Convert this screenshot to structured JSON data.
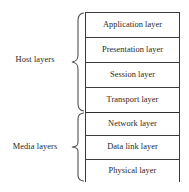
{
  "diagram": {
    "background_color": "#ffffff",
    "border_color": "#3c3c3c",
    "text_color": "#1f1f1f",
    "brace_color": "#4a4a4a"
  },
  "groups": [
    {
      "id": "host",
      "label": "Host layers",
      "brace_glyph": "left-curly-brace",
      "layers": [
        {
          "name": "Application layer"
        },
        {
          "name": "Presentation layer"
        },
        {
          "name": "Session layer"
        },
        {
          "name": "Transport layer"
        }
      ]
    },
    {
      "id": "media",
      "label": "Media layers",
      "brace_glyph": "left-curly-brace",
      "layers": [
        {
          "name": "Network layer"
        },
        {
          "name": "Data link layer"
        },
        {
          "name": "Physical layer"
        }
      ]
    }
  ]
}
